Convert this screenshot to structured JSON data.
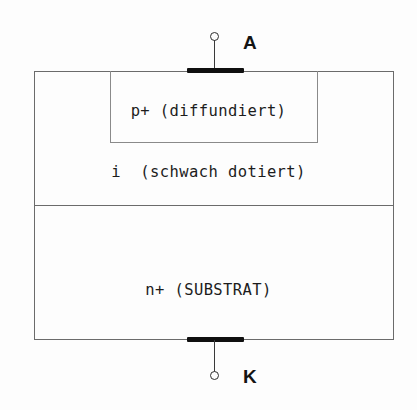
{
  "diagram": {
    "layers": [
      {
        "id": "p-plus",
        "label": "p+ (diffundiert)"
      },
      {
        "id": "intrinsic",
        "label": "i  (schwach dotiert)"
      },
      {
        "id": "n-plus",
        "label": "n+ (SUBSTRAT)"
      }
    ],
    "terminals": [
      {
        "id": "anode",
        "label": "A",
        "icon": "terminal-circle-icon"
      },
      {
        "id": "cathode",
        "label": "K",
        "icon": "terminal-circle-icon"
      }
    ],
    "colors": {
      "background": "#fdfdfd",
      "outline": "#6b6b6b",
      "inner_outline": "#8a8a8a",
      "contact": "#101010",
      "text": "#1c1c1c",
      "terminal_text": "#141414"
    }
  }
}
